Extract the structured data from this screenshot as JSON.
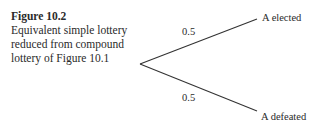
{
  "caption": {
    "title": "Figure 10.2",
    "text": "Equivalent simple lottery reduced from compound lottery of Figure 10.1"
  },
  "tree": {
    "root": {
      "x": 140,
      "y": 64
    },
    "branches": [
      {
        "probability": "0.5",
        "outcome": "A elected",
        "end": {
          "x": 257,
          "y": 19
        }
      },
      {
        "probability": "0.5",
        "outcome": "A defeated",
        "end": {
          "x": 257,
          "y": 111
        }
      }
    ]
  }
}
